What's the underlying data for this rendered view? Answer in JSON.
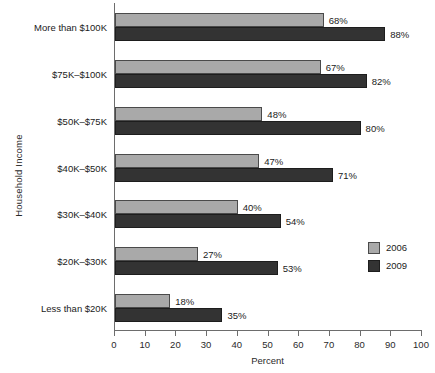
{
  "chart_data": {
    "type": "bar",
    "orientation": "horizontal",
    "title": "",
    "xlabel": "Percent",
    "ylabel": "Household Income",
    "xlim": [
      0,
      100
    ],
    "xticks": [
      0,
      10,
      20,
      30,
      40,
      50,
      60,
      70,
      80,
      90,
      100
    ],
    "grid": false,
    "legend_position": "right-middle",
    "categories": [
      "More than $100K",
      "$75K–$100K",
      "$50K–$75K",
      "$40K–$50K",
      "$30K–$40K",
      "$20K–$30K",
      "Less than $20K"
    ],
    "series": [
      {
        "name": "2006",
        "color": "#a9a9a9",
        "values": [
          68,
          67,
          48,
          47,
          40,
          27,
          18
        ],
        "labels": [
          "68%",
          "67%",
          "48%",
          "47%",
          "40%",
          "27%",
          "18%"
        ]
      },
      {
        "name": "2009",
        "color": "#333333",
        "values": [
          88,
          82,
          80,
          71,
          54,
          53,
          35
        ],
        "labels": [
          "88%",
          "82%",
          "80%",
          "71%",
          "54%",
          "53%",
          "35%"
        ]
      }
    ]
  },
  "axis": {
    "x_tick_labels": [
      "0",
      "10",
      "20",
      "30",
      "40",
      "50",
      "60",
      "70",
      "80",
      "90",
      "100"
    ],
    "x_title": "Percent",
    "y_title": "Household Income"
  },
  "legend": {
    "items": [
      {
        "label": "2006",
        "color": "#a9a9a9"
      },
      {
        "label": "2009",
        "color": "#333333"
      }
    ]
  }
}
